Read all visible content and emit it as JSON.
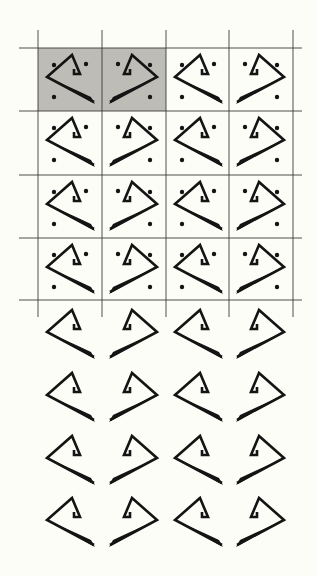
{
  "figure": {
    "colors": {
      "background": "#fdfdf8",
      "ink": "#141414",
      "grid_line": "#3a3a3a",
      "shaded_cell": "#bdbcb6"
    },
    "grid": {
      "columns_x": [
        38,
        102,
        166,
        229,
        293
      ],
      "rows_y": [
        48,
        111,
        175,
        238,
        300
      ],
      "h_line_left": 19,
      "h_line_right": 302,
      "v_line_top": 30,
      "v_line_bottom": 317,
      "shaded_cells": [
        [
          0,
          0
        ],
        [
          0,
          1
        ]
      ]
    },
    "upper_block": {
      "rows": 4,
      "columns": 4,
      "has_grid": true,
      "has_dots": true,
      "column_orientations": [
        "left",
        "right",
        "left",
        "right"
      ]
    },
    "lower_block": {
      "rows": 4,
      "columns": 4,
      "has_grid": false,
      "has_dots": false,
      "row_origins_y": [
        303,
        366,
        429,
        491
      ],
      "column_orientations": [
        "left",
        "right",
        "left",
        "right"
      ]
    }
  }
}
